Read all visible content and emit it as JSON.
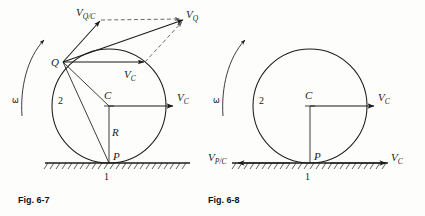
{
  "page": {
    "background": "#fdfdfc",
    "ink": "#1b1b1b"
  },
  "figures": [
    {
      "id": "fig-6-7",
      "caption": "Fig. 6-7",
      "body_number": "2",
      "ground_number": "1",
      "omega_symbol": "ω",
      "points": [
        {
          "name": "Q",
          "label": "Q"
        },
        {
          "name": "C",
          "label": "C"
        },
        {
          "name": "P",
          "label": "P"
        }
      ],
      "dimension_label": "R",
      "vectors": [
        {
          "name": "v-q-over-c",
          "label": "V",
          "sub": "Q/C"
        },
        {
          "name": "v-q",
          "label": "V",
          "sub": "Q"
        },
        {
          "name": "v-c-at-q",
          "label": "V",
          "sub": "C"
        },
        {
          "name": "v-c-at-center",
          "label": "V",
          "sub": "C"
        }
      ]
    },
    {
      "id": "fig-6-8",
      "caption": "Fig. 6-8",
      "body_number": "2",
      "ground_number": "1",
      "omega_symbol": "ω",
      "points": [
        {
          "name": "C",
          "label": "C"
        },
        {
          "name": "P",
          "label": "P"
        }
      ],
      "vectors": [
        {
          "name": "v-c-at-center",
          "label": "V",
          "sub": "C"
        },
        {
          "name": "v-p-over-c",
          "label": "V",
          "sub": "P/C"
        },
        {
          "name": "v-c-on-ground",
          "label": "V",
          "sub": "C"
        }
      ]
    }
  ]
}
